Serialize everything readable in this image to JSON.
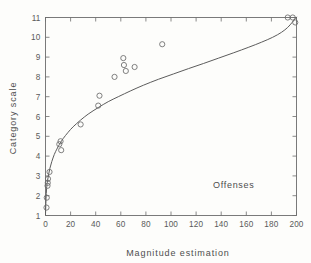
{
  "figure": {
    "background_color": "#fdfdfb",
    "ink_color": "#5c5c5c"
  },
  "chart_data": {
    "type": "scatter",
    "title": "",
    "subtitle": "",
    "xlabel": "Magnitude estimation",
    "ylabel": "Category scale",
    "xlim": [
      0,
      200
    ],
    "ylim": [
      1,
      11
    ],
    "xticks": [
      0,
      20,
      40,
      60,
      80,
      100,
      120,
      140,
      160,
      180,
      200
    ],
    "xtick_labels": [
      "0",
      "20",
      "40",
      "60",
      "80",
      "100",
      "120",
      "140",
      "160",
      "180",
      "200"
    ],
    "yticks": [
      1,
      2,
      3,
      4,
      5,
      6,
      7,
      8,
      9,
      10,
      11
    ],
    "ytick_labels": [
      "1",
      "2",
      "3",
      "4",
      "5",
      "6",
      "7",
      "8",
      "9",
      "10",
      "11"
    ],
    "grid": false,
    "legend": false,
    "legend_position": "none",
    "marker_style": "open-circle",
    "marker_radius_px": 2.6,
    "annotations": [
      {
        "text": "Offenses",
        "x": 150,
        "y": 2.4
      }
    ],
    "series": [
      {
        "name": "Offenses",
        "marker": "open-circle",
        "points": [
          {
            "x": 0.8,
            "y": 1.4
          },
          {
            "x": 1.0,
            "y": 1.9
          },
          {
            "x": 1.6,
            "y": 2.5
          },
          {
            "x": 1.8,
            "y": 2.65
          },
          {
            "x": 2.0,
            "y": 2.85
          },
          {
            "x": 3.2,
            "y": 3.2
          },
          {
            "x": 11.0,
            "y": 4.6
          },
          {
            "x": 12.0,
            "y": 4.75
          },
          {
            "x": 12.5,
            "y": 4.3
          },
          {
            "x": 28.0,
            "y": 5.6
          },
          {
            "x": 42.0,
            "y": 6.55
          },
          {
            "x": 43.0,
            "y": 7.05
          },
          {
            "x": 55.0,
            "y": 8.0
          },
          {
            "x": 62.0,
            "y": 8.95
          },
          {
            "x": 62.5,
            "y": 8.6
          },
          {
            "x": 64.0,
            "y": 8.3
          },
          {
            "x": 71.0,
            "y": 8.5
          },
          {
            "x": 93.0,
            "y": 9.65
          },
          {
            "x": 193.0,
            "y": 11.0
          },
          {
            "x": 197.0,
            "y": 11.0
          },
          {
            "x": 199.0,
            "y": 10.75
          }
        ]
      }
    ],
    "fit_curve": {
      "name": "fitted logarithmic curve",
      "points": [
        {
          "x": 0.0,
          "y": 1.05
        },
        {
          "x": 0.5,
          "y": 1.95
        },
        {
          "x": 1.0,
          "y": 2.45
        },
        {
          "x": 1.6,
          "y": 2.75
        },
        {
          "x": 2.4,
          "y": 3.05
        },
        {
          "x": 3.5,
          "y": 3.38
        },
        {
          "x": 5.0,
          "y": 3.72
        },
        {
          "x": 7.0,
          "y": 4.08
        },
        {
          "x": 9.0,
          "y": 4.35
        },
        {
          "x": 11.0,
          "y": 4.58
        },
        {
          "x": 14.0,
          "y": 4.88
        },
        {
          "x": 18.0,
          "y": 5.2
        },
        {
          "x": 22.0,
          "y": 5.48
        },
        {
          "x": 28.0,
          "y": 5.82
        },
        {
          "x": 34.0,
          "y": 6.12
        },
        {
          "x": 42.0,
          "y": 6.45
        },
        {
          "x": 50.0,
          "y": 6.75
        },
        {
          "x": 58.0,
          "y": 7.0
        },
        {
          "x": 68.0,
          "y": 7.3
        },
        {
          "x": 78.0,
          "y": 7.58
        },
        {
          "x": 90.0,
          "y": 7.88
        },
        {
          "x": 102.0,
          "y": 8.15
        },
        {
          "x": 114.0,
          "y": 8.42
        },
        {
          "x": 126.0,
          "y": 8.68
        },
        {
          "x": 138.0,
          "y": 8.95
        },
        {
          "x": 150.0,
          "y": 9.22
        },
        {
          "x": 162.0,
          "y": 9.5
        },
        {
          "x": 172.0,
          "y": 9.75
        },
        {
          "x": 181.0,
          "y": 10.0
        },
        {
          "x": 188.0,
          "y": 10.25
        },
        {
          "x": 193.0,
          "y": 10.5
        },
        {
          "x": 196.5,
          "y": 10.75
        },
        {
          "x": 199.0,
          "y": 10.95
        },
        {
          "x": 200.0,
          "y": 11.02
        }
      ]
    }
  }
}
